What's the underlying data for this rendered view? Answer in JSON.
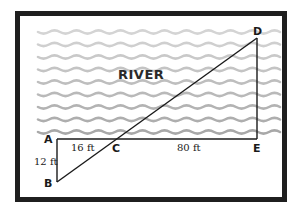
{
  "diagram": {
    "region_label": "RIVER",
    "points": [
      {
        "id": "A",
        "label": "A",
        "x": 57,
        "y": 139,
        "lx": 44,
        "ly": 143
      },
      {
        "id": "B",
        "label": "B",
        "x": 57,
        "y": 182,
        "lx": 44,
        "ly": 187
      },
      {
        "id": "C",
        "label": "C",
        "x": 116,
        "y": 139,
        "lx": 112,
        "ly": 152
      },
      {
        "id": "D",
        "label": "D",
        "x": 257,
        "y": 38,
        "lx": 253,
        "ly": 35
      },
      {
        "id": "E",
        "label": "E",
        "x": 257,
        "y": 139,
        "lx": 253,
        "ly": 152
      }
    ],
    "segments": [
      {
        "name": "segment-AE",
        "from": "A",
        "to": "E"
      },
      {
        "name": "segment-AB",
        "from": "A",
        "to": "B"
      },
      {
        "name": "segment-DE",
        "from": "D",
        "to": "E"
      },
      {
        "name": "segment-BD",
        "from": "B",
        "to": "D"
      }
    ],
    "measurements": {
      "AB": "12 ft",
      "AC": "16 ft",
      "CE": "80 ft"
    },
    "colors": {
      "frame": "#1f1f1f",
      "lines": "#1a1a1a",
      "wave_light": "#d4d4d4",
      "wave_dark": "#a8a8a8"
    }
  }
}
